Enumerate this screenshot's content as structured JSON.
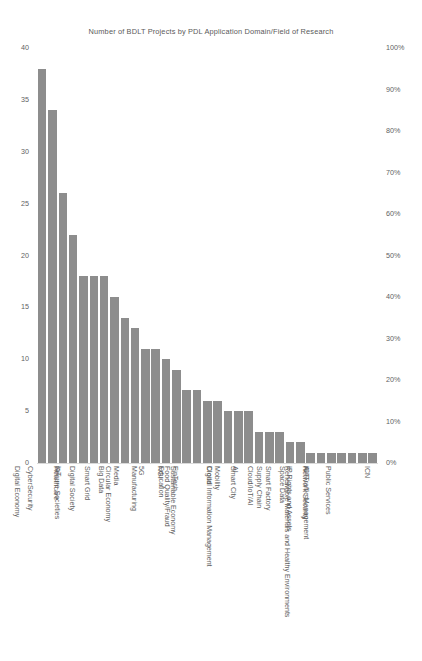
{
  "chart_data": {
    "type": "bar",
    "title": "Number of BDLT Projects by PDL Application Domain/Field of Research",
    "xlabel": "",
    "ylabel": "",
    "ylim": [
      0,
      40
    ],
    "grid": false,
    "legend": null,
    "categories": [
      "Digital Economy",
      "CyberSecurity",
      "IoT",
      "Healthcare",
      "Secure Societies",
      "Digital Society",
      "Smart Grid",
      "Big Data",
      "Media",
      "Circular Economy",
      "5G",
      "Manufacturing",
      "NGI",
      "Education",
      "FinTech",
      "Food Quality/Fraud",
      "Sustainable Economy",
      "Cloud",
      "Mobility",
      "AI",
      "Smart City",
      "Digital Information Management",
      "Cloud/IoT/AI",
      "Supply Chain",
      "Smart Factory",
      "Space Data",
      "ICT",
      "IP Rights and Assets",
      "Network Security",
      "Air Traffic Management",
      "Public Services",
      "Renewable Materials and Healthy Environments",
      "ICN"
    ],
    "values": [
      38,
      34,
      26,
      22,
      18,
      18,
      18,
      16,
      14,
      13,
      11,
      11,
      10,
      9,
      7,
      7,
      6,
      6,
      5,
      5,
      5,
      3,
      3,
      3,
      2,
      2,
      1,
      1,
      1,
      1,
      1,
      1,
      1
    ],
    "left_axis": {
      "ticks": [
        "40",
        "35",
        "30",
        "25",
        "20",
        "15",
        "10",
        "5",
        "0"
      ],
      "tick_values": [
        40,
        35,
        30,
        25,
        20,
        15,
        10,
        5,
        0
      ]
    },
    "right_axis": {
      "ticks": [
        "100%",
        "90%",
        "80%",
        "70%",
        "60%",
        "50%",
        "40%",
        "30%",
        "20%",
        "10%",
        "0%"
      ],
      "tick_values": [
        100,
        90,
        80,
        70,
        60,
        50,
        40,
        30,
        20,
        10,
        0
      ]
    },
    "colors": {
      "bar": "#8d8d8d",
      "text": "#5f5f5f",
      "background": "#ffffff",
      "baseline": "#d9d9d9"
    }
  }
}
